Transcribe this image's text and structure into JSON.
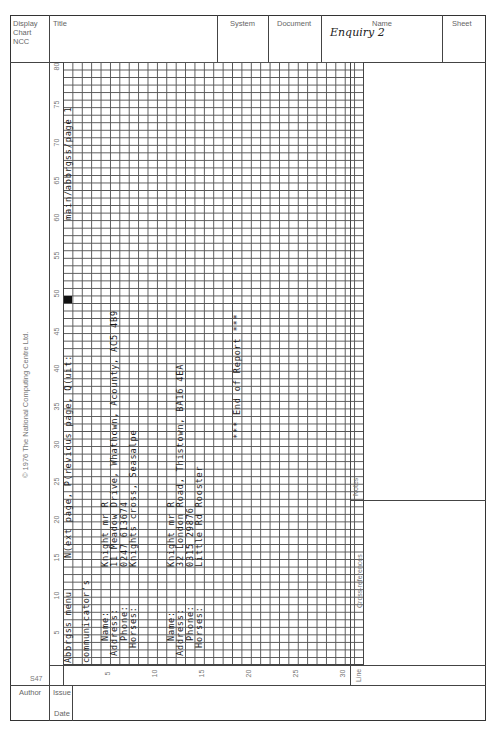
{
  "header": {
    "form_type_lines": [
      "Display",
      "Chart",
      "NCC"
    ],
    "title_label": "Title",
    "title_value": "",
    "system_label": "System",
    "system_value": "",
    "document_label": "Document",
    "document_value": "",
    "name_label": "Name",
    "name_value": "Enquiry 2",
    "sheet_label": "Sheet",
    "sheet_value": ""
  },
  "copyright": "© 1976 The National Computing Centre Ltd.",
  "form_code": "S47",
  "grid": {
    "columns": 32,
    "rows": 80,
    "row_labels": [
      "5",
      "10",
      "15",
      "20",
      "25",
      "30",
      "35",
      "40",
      "45",
      "50",
      "55",
      "60",
      "65",
      "70",
      "75",
      "80"
    ],
    "col_labels": [
      "5",
      "10",
      "15",
      "20",
      "25",
      "30"
    ],
    "filled_cell": {
      "col": 1,
      "row": 50
    },
    "entries": [
      {
        "col": 1,
        "row_start": 1,
        "text": "Abbrgss menu"
      },
      {
        "col": 1,
        "row_start": 15,
        "text": "N(ext page, P(revious page, Q(uit:"
      },
      {
        "col": 1,
        "row_start": 60,
        "text": "main/abbrgss/page 1"
      },
      {
        "col": 3,
        "row_start": 1,
        "text": "communicator's"
      },
      {
        "col": 5,
        "row_start": 4,
        "text": "Name:"
      },
      {
        "col": 5,
        "row_start": 14,
        "text": "Knight mr R"
      },
      {
        "col": 6,
        "row_start": 2,
        "text": "Address:"
      },
      {
        "col": 6,
        "row_start": 14,
        "text": "11 Meadow Drive, Whathown, Acounty, AC5 4B9"
      },
      {
        "col": 7,
        "row_start": 4,
        "text": "Phone:"
      },
      {
        "col": 7,
        "row_start": 14,
        "text": "0247 613674"
      },
      {
        "col": 8,
        "row_start": 3,
        "text": "Horses:"
      },
      {
        "col": 8,
        "row_start": 14,
        "text": "Knights cross, Seasalpe"
      },
      {
        "col": 12,
        "row_start": 4,
        "text": "Name:"
      },
      {
        "col": 12,
        "row_start": 14,
        "text": "Knight mr R"
      },
      {
        "col": 13,
        "row_start": 2,
        "text": "Address:"
      },
      {
        "col": 13,
        "row_start": 14,
        "text": "32 London Road, Thistown, BA16 4EA"
      },
      {
        "col": 14,
        "row_start": 4,
        "text": "Phone:"
      },
      {
        "col": 14,
        "row_start": 14,
        "text": "0315 29876"
      },
      {
        "col": 15,
        "row_start": 3,
        "text": "Horses:"
      },
      {
        "col": 15,
        "row_start": 14,
        "text": "Little Rd Rooster"
      },
      {
        "col": 19,
        "row_start": 31,
        "text": "*** End of Report ***"
      }
    ]
  },
  "right_panel": {
    "notes_label": "Notes",
    "notes_value": "",
    "cross_references_label": "Cross-references",
    "cross_references_value": "",
    "line_label": "Line",
    "line_value": ""
  },
  "footer": {
    "author_label": "Author",
    "author_value": "",
    "issue_label": "Issue",
    "issue_value": "",
    "date_label": "Date",
    "date_value": ""
  }
}
